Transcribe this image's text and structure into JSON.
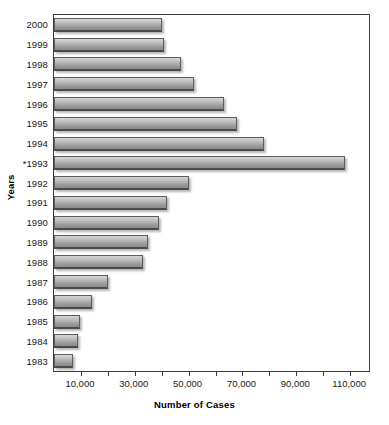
{
  "chart_data": {
    "type": "bar",
    "orientation": "horizontal",
    "title": "",
    "xlabel": "Number of Cases",
    "ylabel": "Years",
    "categories": [
      "2000",
      "1999",
      "1998",
      "1997",
      "1996",
      "1995",
      "1994",
      "*1993",
      "1992",
      "1991",
      "1990",
      "1989",
      "1988",
      "1987",
      "1986",
      "1985",
      "1984",
      "1983"
    ],
    "values": [
      40000,
      41000,
      47000,
      52000,
      63000,
      68000,
      78000,
      108000,
      50000,
      42000,
      39000,
      35000,
      33000,
      20000,
      14000,
      9500,
      9000,
      7000
    ],
    "xlim": [
      0,
      117000
    ],
    "xticks": [
      10000,
      20000,
      30000,
      40000,
      50000,
      60000,
      70000,
      80000,
      90000,
      100000,
      110000
    ],
    "xtick_labels": [
      "10,000",
      "",
      "30,000",
      "",
      "50,000",
      "",
      "70,000",
      "",
      "90,000",
      "",
      "110,000"
    ],
    "grid": false,
    "legend": false,
    "footnote_marker": "*"
  },
  "axes": {
    "x_title": "Number of Cases",
    "y_title": "Years"
  },
  "colors": {
    "bar_light": "#d6d6d6",
    "bar_dark": "#8b8b8b",
    "bar_border": "#5d5d5d",
    "frame": "#3c3c3c",
    "text": "#1a1a1a"
  },
  "title_remnant": ""
}
